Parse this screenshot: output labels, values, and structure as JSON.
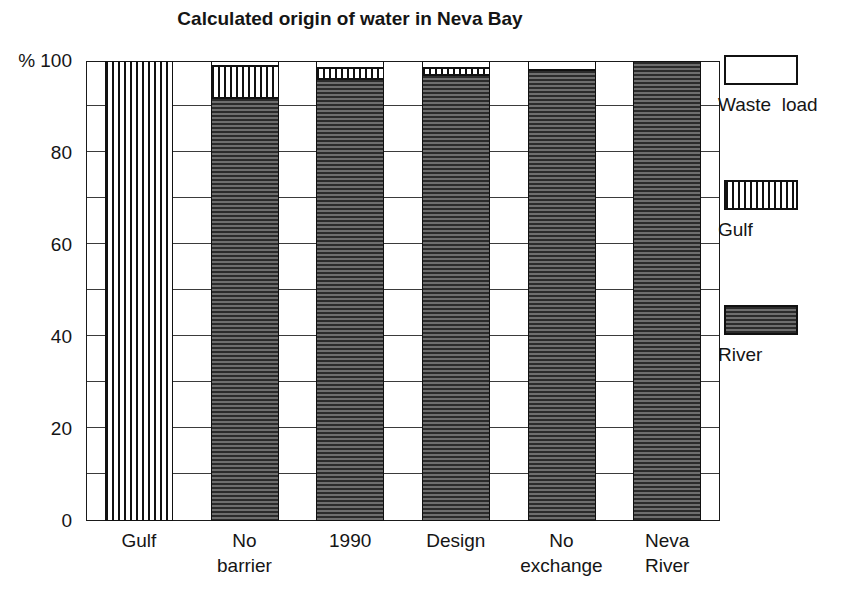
{
  "chart_data": {
    "type": "bar",
    "title": "Calculated origin of water in Neva Bay",
    "subtitle": "",
    "xlabel": "",
    "ylabel": "%",
    "ylim": [
      0,
      100
    ],
    "yticks": [
      0,
      20,
      40,
      60,
      80,
      100
    ],
    "ytick_labels": [
      "0",
      "20",
      "40",
      "60",
      "80",
      "100"
    ],
    "y_unit_prefix": "%",
    "grid": "horizontal-minor-every-10",
    "stacked": true,
    "legend_position": "right",
    "categories": [
      "Gulf",
      "No barrier",
      "1990",
      "Design",
      "No exchange",
      "Neva River"
    ],
    "category_lines": [
      [
        "Gulf"
      ],
      [
        "No",
        "barrier"
      ],
      [
        "1990"
      ],
      [
        "Design"
      ],
      [
        "No",
        "exchange"
      ],
      [
        "Neva",
        "River"
      ]
    ],
    "series": [
      {
        "name": "River",
        "pattern": "checker-dark",
        "values": [
          0,
          92,
          96,
          97,
          98,
          100
        ]
      },
      {
        "name": "Gulf",
        "pattern": "vertical-stripes",
        "values": [
          100,
          7,
          2.5,
          1.5,
          0,
          0
        ]
      },
      {
        "name": "Waste  load",
        "pattern": "solid-white",
        "values": [
          0,
          1,
          1.5,
          1.5,
          2,
          0
        ]
      }
    ],
    "stack_order_bottom_to_top": [
      "River",
      "Gulf",
      "Waste  load"
    ],
    "legend": [
      {
        "name": "Waste  load",
        "pattern": "solid-white"
      },
      {
        "name": "Gulf",
        "pattern": "vertical-stripes"
      },
      {
        "name": "River",
        "pattern": "checker-dark"
      }
    ],
    "colors": {
      "axis": "#111111",
      "grid": "#3b3b3b",
      "text": "#151515",
      "river_fill": "#4a4a4a",
      "background": "#ffffff"
    }
  }
}
